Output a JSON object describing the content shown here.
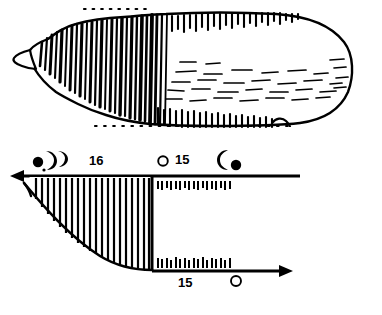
{
  "figure": {
    "ink_color": "#000000",
    "background_color": "#ffffff"
  },
  "artifact": {
    "name": "engraved bone plaque",
    "description": "Elongated artifact, pointed at left, rounded at right, with dense vertical engraved striations on the left half, comb-like short marks along the upper and lower edges of the right half, and horizontal dash marks across the interior.",
    "outline": {
      "left_tip_x": 30,
      "right_end_x": 352,
      "top_y": 14,
      "bottom_y": 126
    },
    "dotted_guide_lines": [
      {
        "name": "upper-dotted-line",
        "x1": 84,
        "x2": 150,
        "y": 9
      },
      {
        "name": "lower-dotted-line",
        "x1": 95,
        "x2": 288,
        "y": 126
      }
    ],
    "striation_count": 26,
    "edge_tick_count_top": 24,
    "edge_tick_count_bottom": 26,
    "interior_dash_count": 34
  },
  "diagram": {
    "name": "lunar-tally-schematic",
    "hatched_wedge": {
      "name": "hatched-quarter-wedge",
      "hatch_line_count": 22,
      "top_y": 177,
      "bottom_y": 268,
      "left_x": 24,
      "right_x": 152
    },
    "arrows": [
      {
        "name": "upper-left-arrow",
        "direction": "left",
        "x_start": 300,
        "x_end": 10,
        "y": 176
      },
      {
        "name": "lower-right-arrow",
        "direction": "right",
        "x_start": 152,
        "x_end": 292,
        "y": 271
      }
    ],
    "tick_rows": [
      {
        "name": "upper-tick-row",
        "count": 17,
        "x_start": 157,
        "x_end": 232,
        "y": 180,
        "orientation": "below-line"
      },
      {
        "name": "lower-tick-row",
        "count": 17,
        "x_start": 157,
        "x_end": 232,
        "y": 258,
        "orientation": "above-line"
      }
    ],
    "labels": {
      "count_16": "16",
      "count_15_top": "15",
      "count_15_bottom": "15"
    },
    "moon_symbols": [
      {
        "name": "moon-new-filled-left",
        "phase": "new-moon",
        "glyph": "filled-disc",
        "x": 38,
        "y": 162,
        "r": 5
      },
      {
        "name": "moon-crescent-waxing-a",
        "phase": "waxing-crescent",
        "glyph": "crescent",
        "x": 50,
        "y": 158
      },
      {
        "name": "moon-crescent-waxing-b",
        "phase": "waxing-crescent",
        "glyph": "crescent",
        "x": 61,
        "y": 157
      },
      {
        "name": "moon-full-open-top",
        "phase": "full-moon",
        "glyph": "open-circle",
        "x": 163,
        "y": 160,
        "r": 5
      },
      {
        "name": "moon-crescent-waning",
        "phase": "waning-crescent",
        "glyph": "crescent-left",
        "x": 224,
        "y": 157
      },
      {
        "name": "moon-new-filled-right",
        "phase": "new-moon",
        "glyph": "filled-disc",
        "x": 236,
        "y": 164,
        "r": 5
      },
      {
        "name": "moon-full-open-bottom",
        "phase": "full-moon",
        "glyph": "open-circle",
        "x": 236,
        "y": 281,
        "r": 5
      }
    ]
  }
}
